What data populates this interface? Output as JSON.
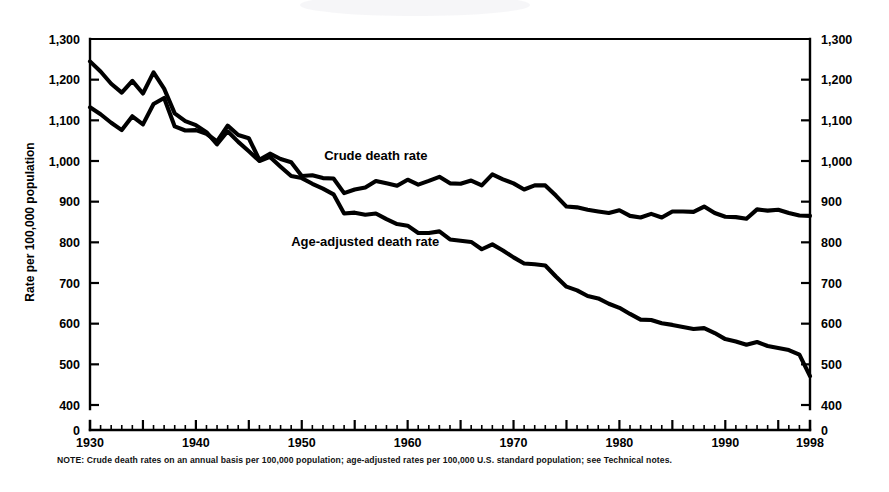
{
  "figure": {
    "note": "NOTE: Crude death rates on an annual basis per 100,000 population; age-adjusted rates per 100,000 U.S. standard population; see Technical notes.",
    "y_axis_title": "Rate per 100,000 population",
    "label_crude": "Crude death rate",
    "label_age_adjusted": "Age-adjusted death rate",
    "zero_label_left": "0",
    "zero_label_right": "0"
  },
  "chart_data": {
    "type": "line",
    "title": "",
    "subtitle": "",
    "xlabel": "",
    "ylabel": "Rate per 100,000 population",
    "xlim": [
      1930,
      1998
    ],
    "ylim": [
      400,
      1300
    ],
    "y_break_below": 400,
    "grid": false,
    "legend": "inline-annotations",
    "y_ticks": [
      400,
      500,
      600,
      700,
      800,
      900,
      1000,
      1100,
      1200,
      1300
    ],
    "y_tick_labels": [
      "400",
      "500",
      "600",
      "700",
      "800",
      "900",
      "1,000",
      "1,100",
      "1,200",
      "1,300"
    ],
    "y_extra_tick": 0,
    "y_extra_tick_label": "0",
    "x_ticks": [
      1930,
      1940,
      1950,
      1960,
      1970,
      1980,
      1990,
      1998
    ],
    "x_tick_labels": [
      "1930",
      "1940",
      "1950",
      "1960",
      "1970",
      "1980",
      "1990",
      "1998"
    ],
    "x_minor_interval": 1,
    "x_major_interval": 5,
    "x": [
      1930,
      1931,
      1932,
      1933,
      1934,
      1935,
      1936,
      1937,
      1938,
      1939,
      1940,
      1941,
      1942,
      1943,
      1944,
      1945,
      1946,
      1947,
      1948,
      1949,
      1950,
      1951,
      1952,
      1953,
      1954,
      1955,
      1956,
      1957,
      1958,
      1959,
      1960,
      1961,
      1962,
      1963,
      1964,
      1965,
      1966,
      1967,
      1968,
      1969,
      1970,
      1971,
      1972,
      1973,
      1974,
      1975,
      1976,
      1977,
      1978,
      1979,
      1980,
      1981,
      1982,
      1983,
      1984,
      1985,
      1986,
      1987,
      1988,
      1989,
      1990,
      1991,
      1992,
      1993,
      1994,
      1995,
      1996,
      1997,
      1998
    ],
    "series": [
      {
        "name": "Age-adjusted death rate",
        "label": "Age-adjusted death rate",
        "label_at_year": 1958,
        "label_at_value": 790,
        "values": [
          1245,
          1220,
          1190,
          1168,
          1197,
          1166,
          1218,
          1178,
          1117,
          1098,
          1088,
          1071,
          1041,
          1073,
          1047,
          1024,
          1000,
          1010,
          986,
          963,
          958,
          944,
          932,
          918,
          871,
          873,
          868,
          871,
          857,
          845,
          841,
          823,
          823,
          827,
          807,
          804,
          801,
          783,
          795,
          780,
          763,
          748,
          746,
          743,
          716,
          691,
          682,
          668,
          662,
          649,
          639,
          624,
          610,
          609,
          601,
          597,
          592,
          587,
          589,
          577,
          562,
          556,
          548,
          555,
          545,
          540,
          535,
          524,
          471
        ]
      },
      {
        "name": "Crude death rate",
        "label": "Crude death rate",
        "label_at_year": 1957,
        "label_at_value": 1003,
        "values": [
          1132,
          1115,
          1094,
          1076,
          1110,
          1090,
          1140,
          1155,
          1085,
          1075,
          1076,
          1067,
          1048,
          1087,
          1064,
          1056,
          1003,
          1018,
          1005,
          997,
          963,
          965,
          958,
          957,
          921,
          930,
          935,
          951,
          945,
          939,
          954,
          942,
          951,
          961,
          945,
          944,
          952,
          940,
          967,
          955,
          945,
          930,
          940,
          940,
          915,
          888,
          886,
          880,
          876,
          872,
          879,
          865,
          861,
          870,
          861,
          876,
          876,
          875,
          888,
          872,
          863,
          862,
          858,
          881,
          878,
          880,
          872,
          866,
          865
        ]
      }
    ],
    "annotations": [
      {
        "text": "Crude death rate",
        "x": 1957,
        "y": 1003
      },
      {
        "text": "Age-adjusted death rate",
        "x": 1956,
        "y": 792
      }
    ]
  }
}
